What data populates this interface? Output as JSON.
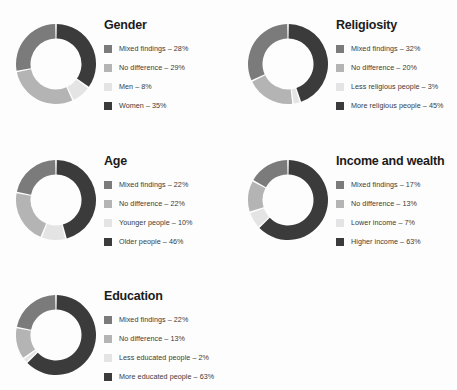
{
  "page": {
    "background_color": "#fdfdfd",
    "title_color": "#1b1b1b",
    "label_color": "#3a3a3a"
  },
  "palette": {
    "mixed_findings": "#7b7b7b",
    "no_difference": "#b4b4b4",
    "light_group": "#e4e4e4",
    "dark_group": "#3b3b3b",
    "gap": "#ffffff"
  },
  "chart_data": [
    {
      "type": "pie",
      "title": "Gender",
      "categories": [
        "Mixed findings",
        "No difference",
        "Men",
        "Women"
      ],
      "values": [
        28,
        29,
        8,
        35
      ],
      "colors": [
        "#7b7b7b",
        "#b4b4b4",
        "#e4e4e4",
        "#3b3b3b"
      ],
      "labels": [
        "Mixed findings – 28%",
        "No difference – 29%",
        "Men – 8%",
        "Women – 35%"
      ],
      "legend_position": "right",
      "donut": true,
      "start_angle": 0,
      "direction": "clockwise",
      "draw_order": [
        "Women",
        "Men",
        "No difference",
        "Mixed findings"
      ]
    },
    {
      "type": "pie",
      "title": "Religiosity",
      "categories": [
        "Mixed findings",
        "No difference",
        "Less religious people",
        "More religious people"
      ],
      "values": [
        32,
        20,
        3,
        45
      ],
      "colors": [
        "#7b7b7b",
        "#b4b4b4",
        "#e4e4e4",
        "#3b3b3b"
      ],
      "labels": [
        "Mixed findings – 32%",
        "No difference – 20%",
        "Less religious people – 3%",
        "More religious people – 45%"
      ],
      "legend_position": "right",
      "donut": true,
      "start_angle": 0,
      "direction": "clockwise",
      "draw_order": [
        "More religious people",
        "Less religious people",
        "No difference",
        "Mixed findings"
      ]
    },
    {
      "type": "pie",
      "title": "Age",
      "categories": [
        "Mixed findings",
        "No difference",
        "Younger people",
        "Older people"
      ],
      "values": [
        22,
        22,
        10,
        46
      ],
      "colors": [
        "#7b7b7b",
        "#b4b4b4",
        "#e4e4e4",
        "#3b3b3b"
      ],
      "labels": [
        "Mixed findings – 22%",
        "No difference – 22%",
        "Younger people – 10%",
        "Older people – 46%"
      ],
      "legend_position": "right",
      "donut": true,
      "start_angle": 0,
      "direction": "clockwise",
      "draw_order": [
        "Older people",
        "Younger people",
        "No difference",
        "Mixed findings"
      ]
    },
    {
      "type": "pie",
      "title": "Income and wealth",
      "categories": [
        "Mixed findings",
        "No difference",
        "Lower income",
        "Higher income"
      ],
      "values": [
        17,
        13,
        7,
        63
      ],
      "colors": [
        "#7b7b7b",
        "#b4b4b4",
        "#e4e4e4",
        "#3b3b3b"
      ],
      "labels": [
        "Mixed findings – 17%",
        "No difference – 13%",
        "Lower income – 7%",
        "Higher income – 63%"
      ],
      "legend_position": "right",
      "donut": true,
      "start_angle": 0,
      "direction": "clockwise",
      "draw_order": [
        "Higher income",
        "Lower income",
        "No difference",
        "Mixed findings"
      ]
    },
    {
      "type": "pie",
      "title": "Education",
      "categories": [
        "Mixed findings",
        "No difference",
        "Less educated people",
        "More educated people"
      ],
      "values": [
        22,
        13,
        2,
        63
      ],
      "colors": [
        "#7b7b7b",
        "#b4b4b4",
        "#e4e4e4",
        "#3b3b3b"
      ],
      "labels": [
        "Mixed findings – 22%",
        "No difference – 13%",
        "Less educated people – 2%",
        "More educated people – 63%"
      ],
      "legend_position": "right",
      "donut": true,
      "start_angle": 0,
      "direction": "clockwise",
      "draw_order": [
        "More educated people",
        "Less educated people",
        "No difference",
        "Mixed findings"
      ]
    }
  ]
}
